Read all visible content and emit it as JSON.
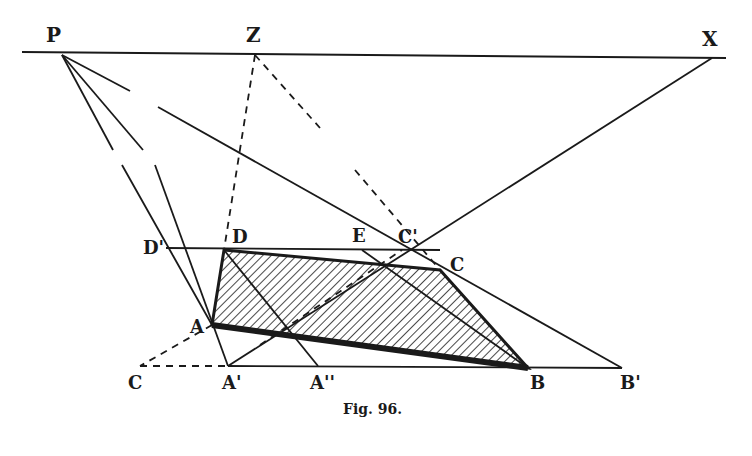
{
  "figure": {
    "caption": "Fig. 96.",
    "colors": {
      "ink": "#1a1a1a",
      "background": "#ffffff"
    }
  },
  "labels": {
    "P": "P",
    "Z": "Z",
    "X": "X",
    "D_prime": "D'",
    "D": "D",
    "E": "E",
    "C_prime": "C'",
    "C": "C",
    "A": "A",
    "C_low": "C",
    "A_prime": "A'",
    "A_double_prime": "A''",
    "B": "B",
    "B_prime": "B'"
  },
  "points": {
    "P": [
      62,
      55
    ],
    "Z": [
      255,
      55
    ],
    "X": [
      712,
      58
    ],
    "D": [
      224,
      250
    ],
    "Dp": [
      166,
      248
    ],
    "E": [
      362,
      250
    ],
    "Cp": [
      402,
      250
    ],
    "C": [
      440,
      270
    ],
    "A": [
      212,
      325
    ],
    "A1": [
      228,
      366
    ],
    "A2": [
      318,
      366
    ],
    "B": [
      528,
      368
    ],
    "Bp": [
      622,
      368
    ],
    "Clow": [
      140,
      366
    ]
  }
}
